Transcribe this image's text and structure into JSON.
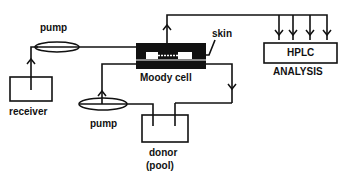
{
  "diagram": {
    "type": "flow-schematic",
    "nodes": {
      "receiver": {
        "label": "receiver"
      },
      "pump_upper": {
        "label": "pump"
      },
      "pump_lower": {
        "label": "pump"
      },
      "moody_cell": {
        "label": "Moody cell"
      },
      "skin": {
        "label": "skin"
      },
      "donor": {
        "label": "donor",
        "sublabel": "(pool)"
      },
      "hplc": {
        "label": "HPLC",
        "sublabel": "ANALYSIS"
      }
    },
    "edges": [
      {
        "from": "receiver",
        "to": "pump_upper"
      },
      {
        "from": "pump_upper",
        "to": "moody_cell"
      },
      {
        "from": "moody_cell",
        "to": "hplc",
        "branches": 4
      },
      {
        "from": "donor",
        "to": "pump_lower"
      },
      {
        "from": "pump_lower",
        "to": "moody_cell"
      },
      {
        "from": "moody_cell",
        "to": "donor"
      }
    ],
    "colors": {
      "ink": "#111111",
      "background": "#ffffff"
    }
  }
}
